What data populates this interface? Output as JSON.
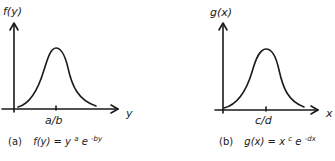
{
  "figure": {
    "panels": [
      {
        "id": "a",
        "y_axis_label": "f(y)",
        "x_axis_label": "y",
        "peak_tick_label": "a/b",
        "caption_tag": "(a)",
        "caption_func": "f(y)",
        "caption_eq": "= y",
        "caption_exp1": "a",
        "caption_base2": "e",
        "caption_exp2": "-by"
      },
      {
        "id": "b",
        "y_axis_label": "g(x)",
        "x_axis_label": "x",
        "peak_tick_label": "c/d",
        "caption_tag": "(b)",
        "caption_func": "g(x)",
        "caption_eq": "= x",
        "caption_exp1": "c",
        "caption_base2": "e",
        "caption_exp2": "-dx"
      }
    ],
    "line_color": "#1a1a1a"
  }
}
